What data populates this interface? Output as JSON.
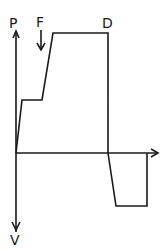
{
  "diagram": {
    "type": "force-displacement waveform",
    "labels": {
      "y_axis_positive": "P",
      "y_axis_negative": "V",
      "marker_force": "F",
      "marker_drop": "D"
    },
    "waveform_segments": [
      {
        "name": "initial-rise",
        "description": "steep rise from origin to first plateau"
      },
      {
        "name": "first-plateau",
        "description": "short flat segment"
      },
      {
        "name": "second-rise",
        "description": "rise at F marker to peak plateau"
      },
      {
        "name": "peak-plateau",
        "description": "flat top ending at D"
      },
      {
        "name": "drop",
        "description": "vertical drop at D through zero axis"
      },
      {
        "name": "negative-ramp",
        "description": "ramp below axis"
      },
      {
        "name": "negative-plateau",
        "description": "flat negative segment"
      },
      {
        "name": "return",
        "description": "vertical return to axis"
      }
    ]
  }
}
